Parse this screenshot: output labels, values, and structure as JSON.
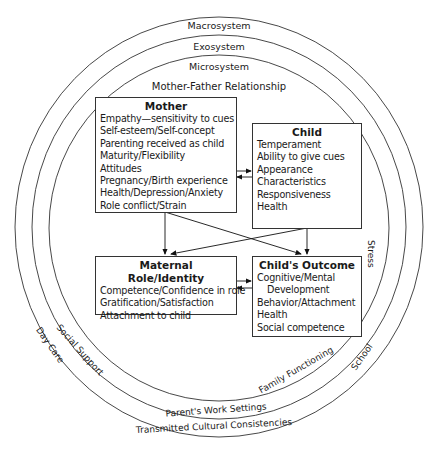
{
  "rings": {
    "macrosystem": "Macrosystem",
    "exosystem": "Exosystem",
    "microsystem": "Microsystem",
    "mother_father": "Mother-Father Relationship",
    "stress": "Stress",
    "school": "School",
    "family_functioning": "Family Functioning",
    "social_support": "Social Support",
    "day_care": "Day Care",
    "parents_work": "Parent's Work Settings",
    "transmitted": "Transmitted Cultural Consistencies"
  },
  "boxes": {
    "mother": {
      "title": "Mother",
      "items": [
        "Empathy—sensitivity to cues",
        "Self-esteem/Self-concept",
        "Parenting received as child",
        "Maturity/Flexibility",
        "Attitudes",
        "Pregnancy/Birth experience",
        "Health/Depression/Anxiety",
        "Role conflict/Strain"
      ]
    },
    "child": {
      "title": "Child",
      "items": [
        "Temperament",
        "Ability to give cues",
        "Appearance",
        "Characteristics",
        "Responsiveness",
        "Health"
      ]
    },
    "maternal_role": {
      "title": "Maternal Role/Identity",
      "items": [
        "Competence/Confidence in role",
        "Gratification/Satisfaction",
        "Attachment to child"
      ]
    },
    "child_outcome": {
      "title": "Child's Outcome",
      "items": [
        "Cognitive/Mental",
        "Development",
        "Behavior/Attachment",
        "Health",
        "Social competence"
      ]
    }
  }
}
